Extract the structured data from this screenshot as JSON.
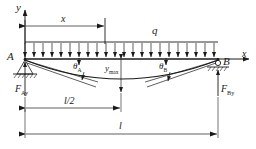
{
  "diagram": {
    "stroke_color": "#1a1a1a",
    "background": "#ffffff"
  },
  "axes": {
    "y_label": "y",
    "x_label": "x",
    "origin_x": 25,
    "origin_y": 59
  },
  "beam": {
    "left_x": 25,
    "right_x": 218,
    "baseline_y": 59,
    "span_label": "l",
    "half_span_label": "l/2"
  },
  "load": {
    "symbol": "q",
    "label": "q",
    "arrow_count": 22,
    "top_y": 42,
    "bottom_y": 59,
    "description": "uniformly distributed downward load"
  },
  "supports": [
    {
      "name": "A",
      "label": "A",
      "type": "pin-support",
      "reaction_label": "F",
      "reaction_sub": "Ay",
      "x": 25
    },
    {
      "name": "B",
      "label": "B",
      "type": "roller-support",
      "reaction_label": "F",
      "reaction_sub": "By",
      "x": 218
    }
  ],
  "angles": [
    {
      "name": "theta-A",
      "label": "θ",
      "sub": "A",
      "x": 78,
      "y": 66
    },
    {
      "name": "theta-B",
      "label": "θ",
      "sub": "B",
      "x": 163,
      "y": 66
    }
  ],
  "deflection": {
    "max_label": "y",
    "max_sub": "max",
    "midspan_x": 121,
    "max_y": 82,
    "curve_description": "sagging elastic curve, maximum deflection at midspan"
  },
  "dimensions": [
    {
      "name": "x-dimension",
      "label": "x",
      "from_x": 25,
      "to_x": 105,
      "y": 25
    },
    {
      "name": "half-span-dimension",
      "label": "l/2",
      "from_x": 25,
      "to_x": 121,
      "y": 108
    },
    {
      "name": "span-dimension",
      "label": "l",
      "from_x": 25,
      "to_x": 218,
      "y": 134
    }
  ]
}
